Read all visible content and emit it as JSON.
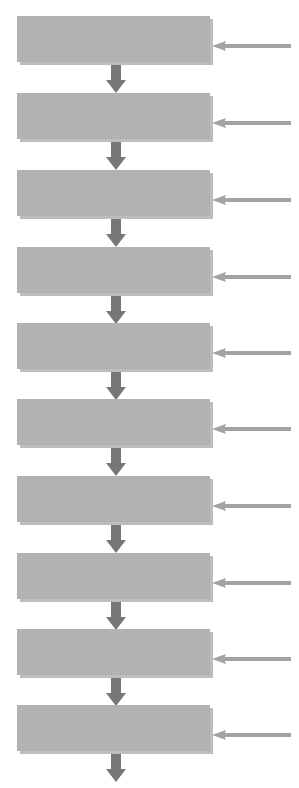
{
  "diagram": {
    "title": "",
    "colors": {
      "box": "#b2b2b2",
      "box_shadow": "#bdbdbd",
      "input_arrow": "#a3a3a3",
      "flow_arrow": "#777777"
    },
    "steps": [
      {
        "label": "",
        "top": 16
      },
      {
        "label": "",
        "top": 93
      },
      {
        "label": "",
        "top": 170
      },
      {
        "label": "",
        "top": 247
      },
      {
        "label": "",
        "top": 323
      },
      {
        "label": "",
        "top": 399
      },
      {
        "label": "",
        "top": 476
      },
      {
        "label": "",
        "top": 553
      },
      {
        "label": "",
        "top": 629
      },
      {
        "label": "",
        "top": 705
      }
    ],
    "step_count": 10
  }
}
